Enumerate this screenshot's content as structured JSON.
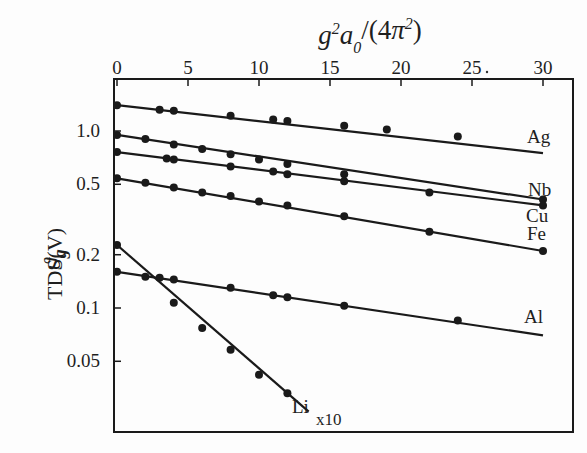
{
  "chart_data": {
    "type": "line",
    "title": "",
    "xlabel": "g²a₀²/(4π²)",
    "ylabel": "ϑg TDS(V)",
    "xaxis_position": "top",
    "xlim": [
      0,
      32
    ],
    "x_ticks": [
      0,
      5,
      10,
      15,
      20,
      25,
      30
    ],
    "y_scale": "log",
    "ylim": [
      0.025,
      1.6
    ],
    "y_ticks": [
      1.0,
      0.5,
      0.2,
      0.1,
      0.05
    ],
    "y_tick_labels": [
      "1.0",
      "0.5",
      "0.2",
      "0.1",
      "0.05"
    ],
    "grid": false,
    "legend": "inline labels at line ends",
    "series": [
      {
        "name": "Ag",
        "fit": {
          "x0": 0,
          "y0": 1.4,
          "x1": 30,
          "y1": 0.75
        },
        "points": [
          [
            0,
            1.4
          ],
          [
            3,
            1.32
          ],
          [
            4,
            1.3
          ],
          [
            8,
            1.22
          ],
          [
            11,
            1.16
          ],
          [
            12,
            1.14
          ],
          [
            16,
            1.07
          ],
          [
            19,
            1.02
          ],
          [
            24,
            0.93
          ]
        ]
      },
      {
        "name": "Nb",
        "fit": {
          "x0": 0,
          "y0": 0.95,
          "x1": 30,
          "y1": 0.41
        },
        "points": [
          [
            0,
            0.95
          ],
          [
            2,
            0.9
          ],
          [
            4,
            0.84
          ],
          [
            6,
            0.79
          ],
          [
            8,
            0.74
          ],
          [
            10,
            0.69
          ],
          [
            12,
            0.65
          ],
          [
            16,
            0.57
          ],
          [
            30,
            0.41
          ]
        ]
      },
      {
        "name": "Cu",
        "fit": {
          "x0": 0,
          "y0": 0.76,
          "x1": 30,
          "y1": 0.38
        },
        "points": [
          [
            0,
            0.76
          ],
          [
            3.5,
            0.7
          ],
          [
            4,
            0.69
          ],
          [
            8,
            0.63
          ],
          [
            11,
            0.59
          ],
          [
            12,
            0.57
          ],
          [
            16,
            0.52
          ],
          [
            22,
            0.45
          ],
          [
            30,
            0.38
          ]
        ]
      },
      {
        "name": "Fe",
        "fit": {
          "x0": 0,
          "y0": 0.54,
          "x1": 30,
          "y1": 0.21
        },
        "points": [
          [
            0,
            0.54
          ],
          [
            2,
            0.51
          ],
          [
            4,
            0.48
          ],
          [
            6,
            0.45
          ],
          [
            8,
            0.43
          ],
          [
            10,
            0.4
          ],
          [
            12,
            0.38
          ],
          [
            16,
            0.33
          ],
          [
            22,
            0.27
          ],
          [
            30,
            0.21
          ]
        ]
      },
      {
        "name": "Al",
        "fit": {
          "x0": 0,
          "y0": 0.16,
          "x1": 30,
          "y1": 0.07
        },
        "points": [
          [
            0,
            0.16
          ],
          [
            2,
            0.15
          ],
          [
            3,
            0.148
          ],
          [
            4,
            0.145
          ],
          [
            8,
            0.13
          ],
          [
            11,
            0.118
          ],
          [
            12,
            0.115
          ],
          [
            16,
            0.103
          ],
          [
            24,
            0.085
          ]
        ]
      },
      {
        "name": "Li",
        "note": "x10",
        "fit": {
          "x0": 0,
          "y0": 0.227,
          "x1": 13.5,
          "y1": 0.026
        },
        "points": [
          [
            0,
            0.227
          ],
          [
            4,
            0.107
          ],
          [
            6,
            0.077
          ],
          [
            8,
            0.058
          ],
          [
            10,
            0.042
          ],
          [
            12,
            0.033
          ]
        ]
      }
    ]
  },
  "labels": {
    "top_axis_title": "g²a₀²/(4π²)",
    "y_axis_title": "TDS(V)",
    "y_axis_symbol": "ϑ",
    "y_axis_subscript": "g",
    "li_multiplier": "x10"
  }
}
